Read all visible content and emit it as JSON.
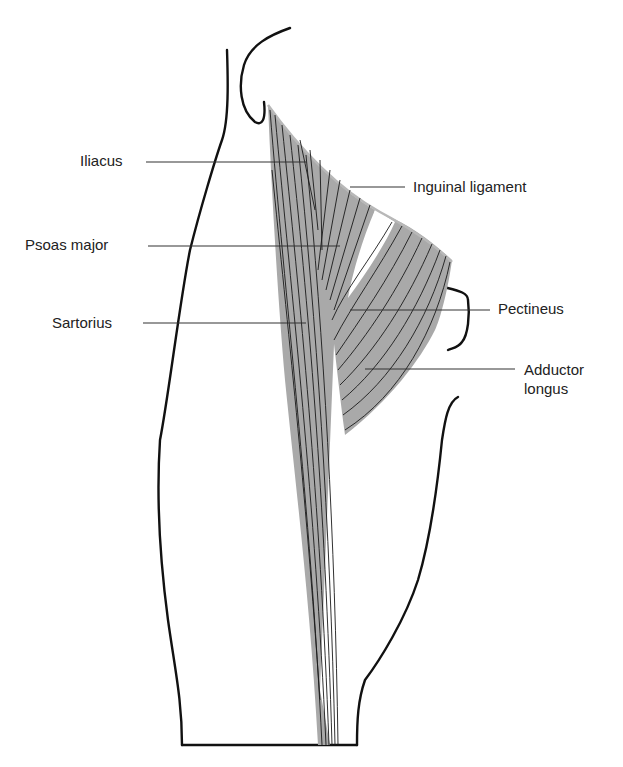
{
  "figure": {
    "fill_color": "#a9a9a9",
    "outline_color": "#111111"
  },
  "labels": {
    "iliacus": "Iliacus",
    "psoas_major": "Psoas major",
    "sartorius": "Sartorius",
    "inguinal_ligament": "Inguinal ligament",
    "pectineus": "Pectineus",
    "adductor_longus_line1": "Adductor",
    "adductor_longus_line2": "longus"
  }
}
